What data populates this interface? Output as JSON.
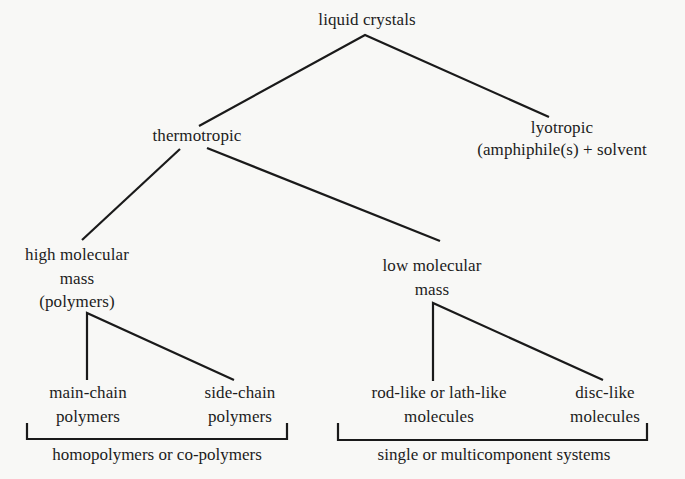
{
  "diagram": {
    "type": "tree",
    "title": "liquid crystals",
    "line_color": "#1a1a1a",
    "nodes": {
      "root": {
        "lines": [
          "liquid crystals"
        ]
      },
      "thermotropic": {
        "lines": [
          "thermotropic"
        ]
      },
      "lyotropic": {
        "lines": [
          "lyotropic",
          "(amphiphile(s) + solvent"
        ]
      },
      "high_mass": {
        "lines": [
          "high molecular",
          "mass",
          "(polymers)"
        ]
      },
      "low_mass": {
        "lines": [
          "low molecular",
          "mass"
        ]
      },
      "main_chain": {
        "lines": [
          "main-chain",
          "polymers"
        ]
      },
      "side_chain": {
        "lines": [
          "side-chain",
          "polymers"
        ]
      },
      "rod_like": {
        "lines": [
          "rod-like or lath-like",
          "molecules"
        ]
      },
      "disc_like": {
        "lines": [
          "disc-like",
          "molecules"
        ]
      }
    },
    "groups": {
      "polymer_group": {
        "caption": "homopolymers or co-polymers"
      },
      "low_mass_group": {
        "caption": "single or multicomponent systems"
      }
    },
    "edges": [
      [
        "root",
        "thermotropic"
      ],
      [
        "root",
        "lyotropic"
      ],
      [
        "thermotropic",
        "high_mass"
      ],
      [
        "thermotropic",
        "low_mass"
      ],
      [
        "high_mass",
        "main_chain"
      ],
      [
        "high_mass",
        "side_chain"
      ],
      [
        "low_mass",
        "rod_like"
      ],
      [
        "low_mass",
        "disc_like"
      ]
    ]
  }
}
